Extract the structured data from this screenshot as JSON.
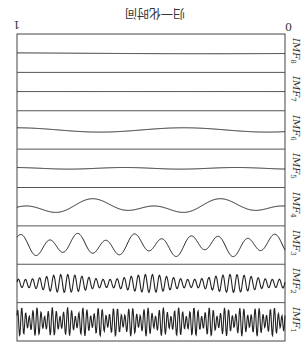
{
  "chart_data": {
    "type": "line",
    "title": "归一化时间",
    "orientation": "rotated-180",
    "xlabel": "归一化时间",
    "x_ticks": [
      {
        "label": "0",
        "x": 288,
        "y": 22
      },
      {
        "label": "1",
        "x": 13,
        "y": 20
      }
    ],
    "xlim": [
      0,
      1
    ],
    "panel_frame": {
      "left": 17,
      "right": 285,
      "top": 34,
      "bottom": 341
    },
    "series": [
      {
        "name": "IMF8",
        "label": "IMF",
        "sub": "8",
        "components": [
          [
            0.5,
            2.5,
            0.2
          ]
        ],
        "amplitude": 3,
        "noise": 0
      },
      {
        "name": "IMF7",
        "label": "IMF",
        "sub": "7",
        "components": [
          [
            0.9,
            4.4,
            0
          ]
        ],
        "amplitude": 11,
        "noise": 0
      },
      {
        "name": "IMF6",
        "label": "IMF",
        "sub": "6",
        "components": [
          [
            1.6,
            1.6,
            0.3
          ]
        ],
        "amplitude": 8,
        "noise": 0
      },
      {
        "name": "IMF5",
        "label": "IMF",
        "sub": "5",
        "components": [
          [
            2.4,
            1.8,
            0.15
          ]
        ],
        "amplitude": 6,
        "noise": 0
      },
      {
        "name": "IMF4",
        "label": "IMF",
        "sub": "4",
        "components": [
          [
            4.2,
            0.5,
            0.4
          ],
          [
            2.1,
            3.9,
            0.35
          ]
        ],
        "amplitude": 12,
        "noise": 0
      },
      {
        "name": "IMF3",
        "label": "IMF",
        "sub": "3",
        "components": [
          [
            9.5,
            0.6,
            0.7
          ],
          [
            4.2,
            2.0,
            0.3
          ]
        ],
        "amplitude": 13,
        "noise": 0
      },
      {
        "name": "IMF2",
        "label": "IMF",
        "sub": "2",
        "components": [
          [
            38,
            0.3,
            1.0
          ]
        ],
        "amplitude": 10,
        "noise": 0,
        "envelope": [
          [
            3.2,
            1.1,
            0.55
          ]
        ]
      },
      {
        "name": "IMF1",
        "label": "IMF",
        "sub": "1",
        "components": [
          [
            70,
            0.2,
            0.8
          ],
          [
            53,
            1.7,
            0.35
          ]
        ],
        "amplitude": 14,
        "noise": 0
      }
    ],
    "legend": "per-panel labels on right",
    "grid": false
  },
  "title": "归一化时间",
  "ticks": {
    "left": "1",
    "right": "0"
  },
  "labels": [
    "IMF8",
    "IMF7",
    "IMF6",
    "IMF5",
    "IMF4",
    "IMF3",
    "IMF2",
    "IMF1"
  ]
}
